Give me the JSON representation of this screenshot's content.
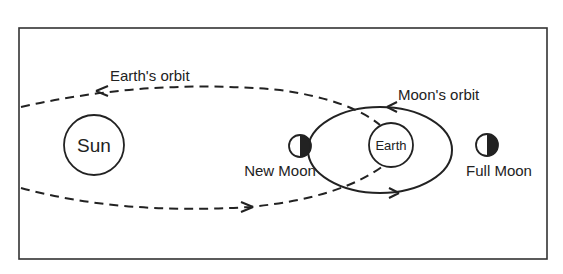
{
  "diagram": {
    "labels": {
      "earth_orbit": "Earth's orbit",
      "moon_orbit": "Moon's orbit",
      "sun": "Sun",
      "earth": "Earth",
      "new_moon": "New Moon",
      "full_moon": "Full Moon"
    },
    "colors": {
      "stroke": "#222222",
      "background": "#ffffff"
    }
  }
}
